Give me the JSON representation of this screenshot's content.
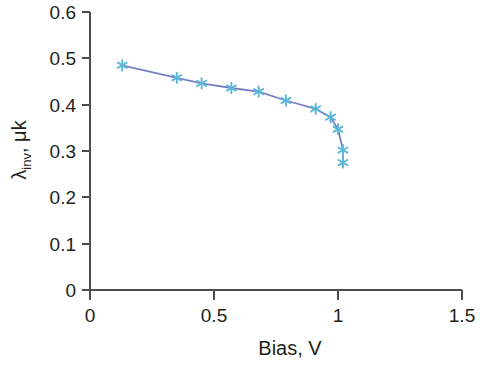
{
  "chart_data": {
    "type": "line",
    "title": "",
    "subtitle": "",
    "xlabel": "Bias, V",
    "ylabel": "λ",
    "ylabel_sub": "inv",
    "ylabel_rest": ", μk",
    "ylabel_full": "λinv, μk",
    "xlim": [
      0,
      1.5
    ],
    "ylim": [
      0,
      0.6
    ],
    "xticks": [
      0,
      0.5,
      1,
      1.5
    ],
    "xtick_labels": [
      "0",
      "0.5",
      "1",
      "1.5"
    ],
    "yticks": [
      0,
      0.1,
      0.2,
      0.3,
      0.4,
      0.5,
      0.6
    ],
    "ytick_labels": [
      "0",
      "0.1",
      "0.2",
      "0.3",
      "0.4",
      "0.5",
      "0.6"
    ],
    "grid": false,
    "legend": false,
    "legend_position": "none",
    "marker_style": "asterisk",
    "marker_color": "#5bb8d8",
    "line_color": "#7b7fc4",
    "axis_color": "#4d4d4f",
    "text_color": "#231f20",
    "background_color": "#ffffff",
    "series": [
      {
        "name": "lambda_inv vs bias",
        "x": [
          0.13,
          0.35,
          0.45,
          0.57,
          0.68,
          0.79,
          0.91,
          0.97,
          1.0,
          1.02,
          1.02
        ],
        "y": [
          0.485,
          0.458,
          0.446,
          0.436,
          0.428,
          0.409,
          0.391,
          0.373,
          0.347,
          0.302,
          0.275
        ]
      }
    ]
  },
  "axes": {
    "x_axis_name": "bias-axis",
    "y_axis_name": "lambda-inv-axis"
  }
}
